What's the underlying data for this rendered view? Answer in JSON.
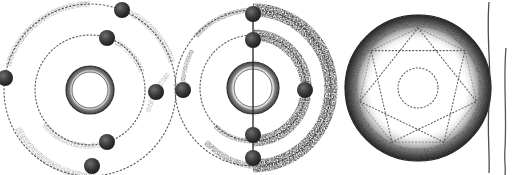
{
  "plate": {
    "title": "Atomic shell model illustrations",
    "medium": "pen-and-ink stipple drawing",
    "background_color": "#ffffff",
    "ink_color": "#2b2b2b",
    "width": 512,
    "height": 175
  },
  "figures": [
    {
      "id": "figure-1",
      "name": "bohr-atom-plain-orbits",
      "description": "Atom with annular nucleus and two dotted electron shells, six electrons",
      "center": {
        "x": 90,
        "y": 90
      },
      "nucleus": {
        "name": "nucleus-annulus",
        "outer_radius": 24,
        "inner_radius": 18,
        "style": "stippled ring"
      },
      "shells": [
        {
          "name": "inner-shell",
          "radius": 55,
          "style": "dotted",
          "electron_count": 3
        },
        {
          "name": "outer-shell",
          "radius": 86,
          "style": "dotted",
          "electron_count": 3
        }
      ],
      "electrons": [
        {
          "shell": "outer",
          "angle_deg": -68,
          "x": 122,
          "y": 10,
          "radius": 8
        },
        {
          "shell": "inner",
          "angle_deg": -72,
          "x": 107,
          "y": 38,
          "radius": 8
        },
        {
          "shell": "outer",
          "angle_deg": 188,
          "x": 5,
          "y": 78,
          "radius": 8
        },
        {
          "shell": "inner",
          "angle_deg": 3,
          "x": 156,
          "y": 92,
          "radius": 8
        },
        {
          "shell": "inner",
          "angle_deg": 70,
          "x": 107,
          "y": 142,
          "radius": 8
        },
        {
          "shell": "outer",
          "angle_deg": 62,
          "x": 92,
          "y": 166,
          "radius": 8
        }
      ],
      "shading": "light stipple arcs along upper-left and lower-left of each shell"
    },
    {
      "id": "figure-2",
      "name": "bohr-atom-shaded-orbits-with-axis",
      "description": "Atom with annular nucleus, vertical polar axis line, two dotted shells with heavy crescent stipple shading on the right, six electrons aligned on the axis",
      "center": {
        "x": 253,
        "y": 88
      },
      "nucleus": {
        "name": "nucleus-annulus",
        "outer_radius": 26,
        "inner_radius": 19,
        "style": "stippled ring"
      },
      "axis": {
        "name": "vertical-axis-line",
        "x": 253,
        "y_top": 12,
        "y_bottom": 160
      },
      "shells": [
        {
          "name": "inner-shell",
          "radius": 53,
          "style": "dotted with right-side crescent shading",
          "electron_count": 3
        },
        {
          "name": "outer-shell",
          "radius": 78,
          "style": "dotted with right-side crescent shading",
          "electron_count": 3
        }
      ],
      "electrons": [
        {
          "shell": "outer",
          "angle_deg": -90,
          "x": 253,
          "y": 14,
          "radius": 8
        },
        {
          "shell": "inner",
          "angle_deg": -90,
          "x": 253,
          "y": 40,
          "radius": 8
        },
        {
          "shell": "outer",
          "angle_deg": 180,
          "x": 183,
          "y": 90,
          "radius": 8
        },
        {
          "shell": "inner",
          "angle_deg": 0,
          "x": 305,
          "y": 90,
          "radius": 8
        },
        {
          "shell": "inner",
          "angle_deg": 90,
          "x": 253,
          "y": 135,
          "radius": 8
        },
        {
          "shell": "outer",
          "angle_deg": 90,
          "x": 253,
          "y": 158,
          "radius": 8
        }
      ],
      "shading": "dense stipple crescents on the right hemisphere of both shells"
    },
    {
      "id": "figure-3",
      "name": "stippled-sphere-with-star-polygon",
      "description": "Shaded sphere with an inscribed dotted star polygon and a small dotted circle at centre",
      "center": {
        "x": 418,
        "y": 88
      },
      "sphere": {
        "name": "sphere-body",
        "radius": 73,
        "rim_style": "dense radial stipple hatching",
        "fill": "white"
      },
      "star_polygon": {
        "name": "star-polygon-7-2",
        "points": 7,
        "step": 2,
        "circumradius": 60,
        "style": "dotted"
      },
      "inner_circle": {
        "name": "inner-dotted-circle",
        "radius": 20,
        "style": "dotted"
      }
    },
    {
      "id": "figure-4-partial",
      "name": "cropped-figure-edge",
      "description": "Left contour edges of a fourth figure, cut off by the right margin",
      "edges": [
        {
          "name": "contour-line-left",
          "x": 489
        },
        {
          "name": "contour-line-right",
          "x": 505
        }
      ]
    }
  ]
}
